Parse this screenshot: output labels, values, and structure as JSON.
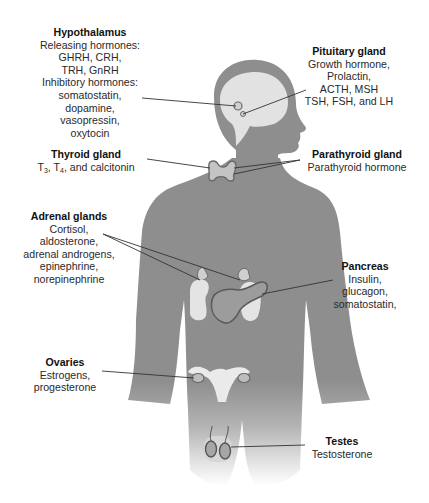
{
  "diagram": {
    "colors": {
      "body": "#8e8e8e",
      "organ_fill": "#e4e4e4",
      "organ_outline": "#6a6a6a",
      "leader_line": "#333333",
      "background": "#ffffff"
    },
    "glands": [
      {
        "id": "hypothalamus",
        "title": "Hypothalamus",
        "lines": [
          "Releasing hormones:",
          "GHRH, CRH,",
          "TRH, GnRH",
          "Inhibitory hormones:",
          "somatostatin,",
          "dopamine,",
          "vasopressin,",
          "oxytocin"
        ]
      },
      {
        "id": "pituitary",
        "title": "Pituitary gland",
        "lines": [
          "Growth hormone,",
          "Prolactin,",
          "ACTH, MSH",
          "TSH, FSH, and LH"
        ]
      },
      {
        "id": "thyroid",
        "title": "Thyroid gland",
        "line_parts": [
          "T",
          "3",
          ", T",
          "4",
          ", and calcitonin"
        ]
      },
      {
        "id": "parathyroid",
        "title": "Parathyroid gland",
        "lines": [
          "Parathyroid hormone"
        ]
      },
      {
        "id": "adrenal",
        "title": "Adrenal glands",
        "lines": [
          "Cortisol,",
          "aldosterone,",
          "adrenal androgens,",
          "epinephrine,",
          "norepinephrine"
        ]
      },
      {
        "id": "pancreas",
        "title": "Pancreas",
        "lines": [
          "Insulin,",
          "glucagon,",
          "somatostatin,"
        ]
      },
      {
        "id": "ovaries",
        "title": "Ovaries",
        "lines": [
          "Estrogens,",
          "progesterone"
        ]
      },
      {
        "id": "testes",
        "title": "Testes",
        "lines": [
          "Testosterone"
        ]
      }
    ]
  }
}
